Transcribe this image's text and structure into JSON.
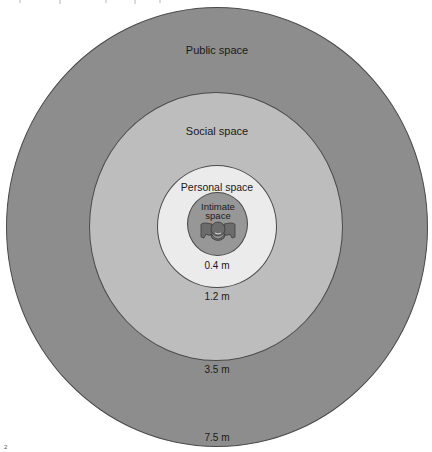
{
  "diagram": {
    "zones": [
      {
        "name": "Public space",
        "distance": "7.5 m",
        "color": "#8d8d8d"
      },
      {
        "name": "Social space",
        "distance": "3.5 m",
        "color": "#bdbdbd"
      },
      {
        "name": "Personal space",
        "distance": "1.2 m",
        "color": "#ebebeb"
      },
      {
        "name": "Intimate space",
        "distance": "0.4 m",
        "color": "#979797"
      }
    ],
    "intimate_label_line1": "Intimate",
    "intimate_label_line2": "space",
    "center_icon": "person-icon",
    "corner_mark": "2"
  }
}
